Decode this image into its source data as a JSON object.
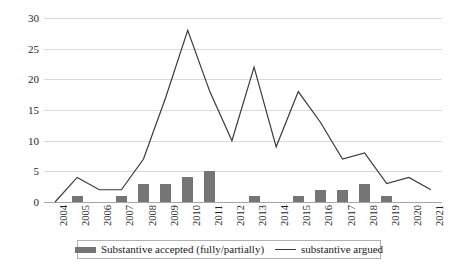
{
  "chart_data": {
    "type": "bar",
    "title": "",
    "subtitle": "",
    "xlabel": "",
    "ylabel": "",
    "ylim": [
      0,
      30
    ],
    "yticks": [
      0,
      5,
      10,
      15,
      20,
      25,
      30
    ],
    "ytick_labels": [
      "0",
      "5",
      "10",
      "15",
      "20",
      "25",
      "30"
    ],
    "grid": true,
    "legend_position": "bottom",
    "categories": [
      "2004",
      "2005",
      "2006",
      "2007",
      "2008",
      "2009",
      "2010",
      "2011",
      "2012",
      "2013",
      "2014",
      "2015",
      "2016",
      "2017",
      "2018",
      "2019",
      "2020",
      "2021"
    ],
    "series": [
      {
        "name": "Substantive accepted (fully/partially)",
        "type": "bar",
        "color": "#757575",
        "values": [
          0,
          1,
          0,
          1,
          3,
          3,
          4,
          5,
          0,
          1,
          0,
          1,
          2,
          2,
          3,
          1,
          0,
          0
        ]
      },
      {
        "name": "substantive argued",
        "type": "line",
        "color": "#3a3a3a",
        "values": [
          0,
          4,
          2,
          2,
          7,
          17,
          28,
          18,
          10,
          22,
          9,
          18,
          13,
          7,
          8,
          3,
          4,
          2
        ]
      }
    ]
  },
  "legend": {
    "items": [
      {
        "label": "Substantive accepted (fully/partially)",
        "marker": "bar-swatch"
      },
      {
        "label": "substantive argued",
        "marker": "line-swatch"
      }
    ]
  }
}
